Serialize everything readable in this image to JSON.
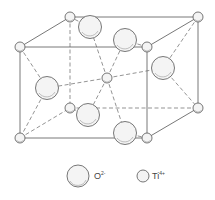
{
  "diagram": {
    "ti_atoms": [
      {
        "id": "ti-front-tl",
        "x": 20,
        "y": 47
      },
      {
        "id": "ti-front-tr",
        "x": 147,
        "y": 47
      },
      {
        "id": "ti-front-bl",
        "x": 20,
        "y": 138
      },
      {
        "id": "ti-front-br",
        "x": 147,
        "y": 138
      },
      {
        "id": "ti-back-tl",
        "x": 70,
        "y": 17
      },
      {
        "id": "ti-back-tr",
        "x": 198,
        "y": 17
      },
      {
        "id": "ti-back-bl",
        "x": 70,
        "y": 108
      },
      {
        "id": "ti-back-br",
        "x": 198,
        "y": 108
      },
      {
        "id": "ti-center",
        "x": 107,
        "y": 78
      }
    ],
    "o_atoms": [
      {
        "id": "o-top-back",
        "x": 90,
        "y": 27
      },
      {
        "id": "o-top-front",
        "x": 125,
        "y": 40
      },
      {
        "id": "o-left",
        "x": 47,
        "y": 88
      },
      {
        "id": "o-right",
        "x": 163,
        "y": 68
      },
      {
        "id": "o-bottom-back",
        "x": 88,
        "y": 115
      },
      {
        "id": "o-bottom-front",
        "x": 125,
        "y": 133
      }
    ],
    "solid_edges": [
      [
        20,
        47,
        147,
        47
      ],
      [
        147,
        47,
        147,
        138
      ],
      [
        147,
        138,
        20,
        138
      ],
      [
        20,
        138,
        20,
        47
      ],
      [
        70,
        17,
        198,
        17
      ],
      [
        198,
        17,
        198,
        108
      ],
      [
        20,
        47,
        70,
        17
      ],
      [
        147,
        47,
        198,
        17
      ],
      [
        147,
        138,
        198,
        108
      ]
    ],
    "dashed_edges": [
      [
        70,
        17,
        70,
        108
      ],
      [
        70,
        108,
        198,
        108
      ],
      [
        20,
        138,
        70,
        108
      ],
      [
        107,
        78,
        90,
        27
      ],
      [
        107,
        78,
        125,
        40
      ],
      [
        107,
        78,
        47,
        88
      ],
      [
        107,
        78,
        163,
        68
      ],
      [
        107,
        78,
        88,
        115
      ],
      [
        107,
        78,
        125,
        133
      ],
      [
        20,
        47,
        47,
        88
      ],
      [
        47,
        88,
        20,
        138
      ],
      [
        198,
        17,
        163,
        68
      ],
      [
        163,
        68,
        198,
        108
      ],
      [
        90,
        27,
        70,
        17
      ],
      [
        125,
        40,
        147,
        47
      ],
      [
        88,
        115,
        70,
        108
      ],
      [
        125,
        133,
        147,
        138
      ]
    ]
  },
  "legend": {
    "oxygen": {
      "symbol": "O",
      "charge": "2-",
      "x": 78,
      "y": 176,
      "r": 11
    },
    "titanium": {
      "symbol": "Ti",
      "charge": "4+",
      "x": 143,
      "y": 176,
      "r": 6
    }
  }
}
